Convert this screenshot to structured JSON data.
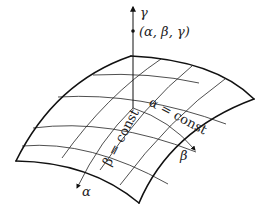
{
  "diagram": {
    "type": "curvilinear-coordinate-surface",
    "labels": {
      "gamma_axis": "γ",
      "point": "(α, β, γ)",
      "alpha_axis": "α",
      "beta_axis": "β",
      "beta_curve": "β = const",
      "alpha_curve": "α = const"
    },
    "colors": {
      "line": "#111111",
      "background": "#ffffff"
    },
    "grid": {
      "rows": 4,
      "cols": 4
    }
  }
}
